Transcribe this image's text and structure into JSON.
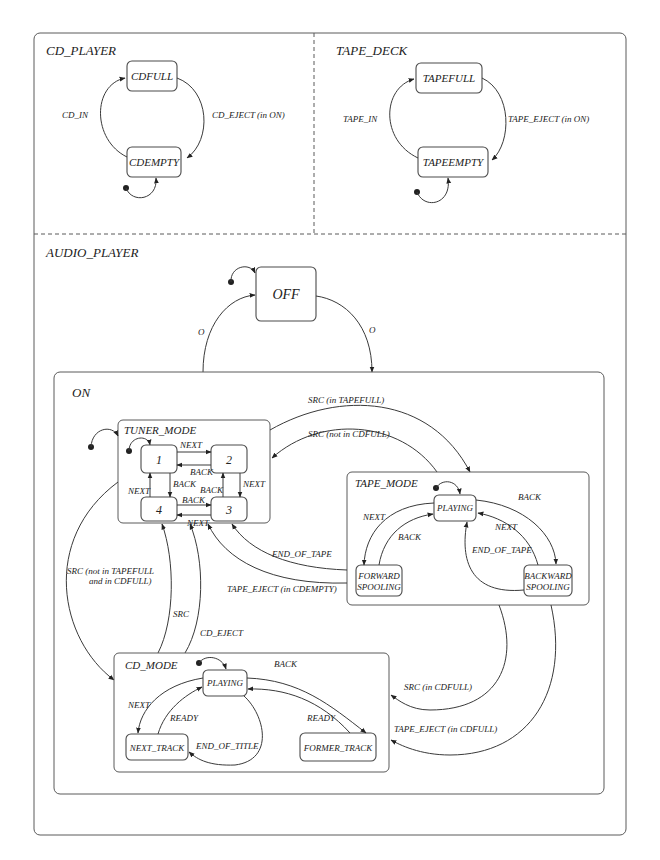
{
  "regions": {
    "cd_player": "CD_PLAYER",
    "tape_deck": "TAPE_DECK",
    "audio_player": "AUDIO_PLAYER",
    "on": "ON",
    "tuner_mode": "TUNER_MODE",
    "tape_mode": "TAPE_MODE",
    "cd_mode": "CD_MODE"
  },
  "states": {
    "cdfull": "CDFULL",
    "cdempty": "CDEMPTY",
    "tapefull": "TAPEFULL",
    "tapeempty": "TAPEEMPTY",
    "off": "OFF",
    "tuner_1": "1",
    "tuner_2": "2",
    "tuner_3": "3",
    "tuner_4": "4",
    "tape_playing": "PLAYING",
    "forward_spooling_1": "FORWARD",
    "forward_spooling_2": "SPOOLING",
    "backward_spooling_1": "BACKWARD",
    "backward_spooling_2": "SPOOLING",
    "cd_playing": "PLAYING",
    "next_track": "NEXT_TRACK",
    "former_track": "FORMER_TRACK"
  },
  "transitions": {
    "cd_in": "CD_IN",
    "cd_eject_in_on": "CD_EJECT (in ON)",
    "tape_in": "TAPE_IN",
    "tape_eject_in_on": "TAPE_EJECT (in ON)",
    "off_to_on": "O",
    "on_to_off": "O",
    "tuner_1_2": "NEXT",
    "tuner_2_1": "BACK",
    "tuner_1_4": "BACK",
    "tuner_4_1": "NEXT",
    "tuner_3_2": "BACK",
    "tuner_2_3": "NEXT",
    "tuner_4_3": "BACK",
    "tuner_3_4": "NEXT",
    "src_in_tapefull": "SRC (in TAPEFULL)",
    "src_not_in_cdfull": "SRC (not in CDFULL)",
    "tape_next": "NEXT",
    "tape_back_fwd": "BACK",
    "tape_back": "BACK",
    "tape_next_bwd": "NEXT",
    "tape_end_of_tape_inner": "END_OF_TAPE",
    "end_of_tape": "END_OF_TAPE",
    "tape_eject_in_cdempty": "TAPE_EJECT (in CDEMPTY)",
    "src_not_tapefull_line1": "SRC (not in TAPEFULL",
    "src_not_tapefull_line2": "and in CDFULL)",
    "src": "SRC",
    "cd_eject": "CD_EJECT",
    "cd_back": "BACK",
    "cd_next": "NEXT",
    "cd_ready_next": "READY",
    "cd_ready_former": "READY",
    "end_of_title": "END_OF_TITLE",
    "src_in_cdfull": "SRC (in CDFULL)",
    "tape_eject_in_cdfull": "TAPE_EJECT (in CDFULL)"
  }
}
